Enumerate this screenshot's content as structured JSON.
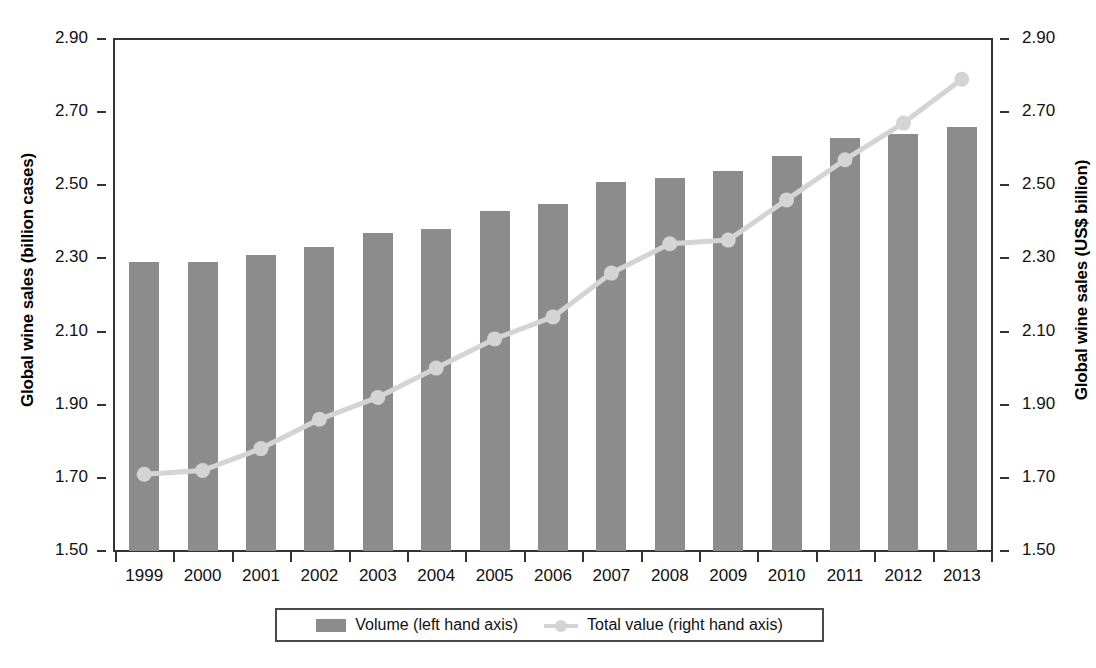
{
  "chart_data": {
    "type": "bar",
    "title": "",
    "categories": [
      "1999",
      "2000",
      "2001",
      "2002",
      "2003",
      "2004",
      "2005",
      "2006",
      "2007",
      "2008",
      "2009",
      "2010",
      "2011",
      "2012",
      "2013"
    ],
    "series": [
      {
        "name": "Volume (left hand axis)",
        "type": "bar",
        "axis": "left",
        "color": "#8c8c8c",
        "values": [
          2.29,
          2.29,
          2.31,
          2.33,
          2.37,
          2.38,
          2.43,
          2.45,
          2.51,
          2.52,
          2.54,
          2.58,
          2.63,
          2.64,
          2.66
        ]
      },
      {
        "name": "Total value (right hand axis)",
        "type": "line",
        "axis": "right",
        "color": "#d4d4d4",
        "values": [
          1.71,
          1.72,
          1.78,
          1.86,
          1.92,
          2.0,
          2.08,
          2.14,
          2.26,
          2.34,
          2.35,
          2.46,
          2.57,
          2.67,
          2.79
        ]
      }
    ],
    "xlabel": "",
    "ylabel_left": "Global wine sales (billion cases)",
    "ylabel_right": "Global wine sales (US$ billion)",
    "ylim": [
      1.5,
      2.9
    ],
    "ytick_values": [
      "1.50",
      "1.70",
      "1.90",
      "2.10",
      "2.30",
      "2.50",
      "2.70",
      "2.90"
    ],
    "ylim_right": [
      1.5,
      2.9
    ],
    "ytick_values_right": [
      "1.50",
      "1.70",
      "1.90",
      "2.10",
      "2.30",
      "2.50",
      "2.70",
      "2.90"
    ],
    "grid": false,
    "legend_position": "bottom"
  },
  "axes": {
    "left_title": "Global wine sales (billion cases)",
    "right_title": "Global wine sales (US$ billion)"
  },
  "legend": {
    "entries": [
      {
        "label": "Volume (left hand axis)",
        "marker": "bar-swatch"
      },
      {
        "label": "Total value (right hand axis)",
        "marker": "line-marker-swatch"
      }
    ]
  }
}
